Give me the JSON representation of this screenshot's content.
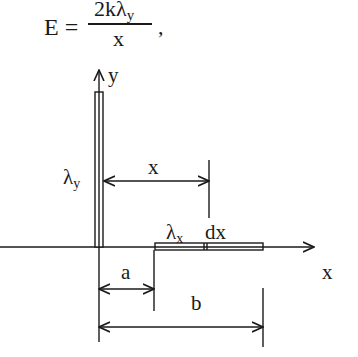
{
  "formula": {
    "lhs": "E =",
    "numerator_main": "2kλ",
    "numerator_sub": "y",
    "denominator": "x",
    "trailing": ","
  },
  "diagram": {
    "y_axis_label": "y",
    "x_axis_label": "x",
    "vertical_rod_label_main": "λ",
    "vertical_rod_label_sub": "y",
    "horizontal_rod_label_main": "λ",
    "horizontal_rod_label_sub": "x",
    "element_label": "dx",
    "distance_x_label": "x",
    "distance_a_label": "a",
    "distance_b_label": "b"
  }
}
